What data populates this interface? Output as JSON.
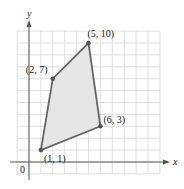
{
  "chart_data": {
    "type": "scatter",
    "title": "",
    "xlabel": "x",
    "ylabel": "y",
    "origin_label": "0",
    "grid": true,
    "xlim": [
      -1,
      11
    ],
    "ylim": [
      -1,
      11
    ],
    "shape": "polygon",
    "fill_color": "#e6e6e6",
    "line_color": "#666666",
    "points": [
      {
        "x": 1,
        "y": 1,
        "label": "(1, 1)"
      },
      {
        "x": 6,
        "y": 3,
        "label": "(6, 3)"
      },
      {
        "x": 5,
        "y": 10,
        "label": "(5, 10)"
      },
      {
        "x": 2,
        "y": 7,
        "label": "(2, 7)"
      }
    ]
  }
}
